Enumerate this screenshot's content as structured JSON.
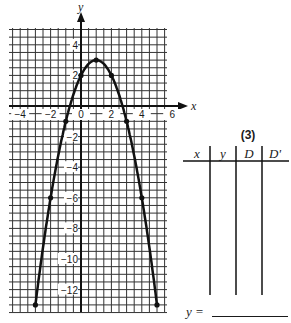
{
  "chart_data": {
    "type": "line",
    "title": "",
    "xlabel": "x",
    "ylabel": "y",
    "xlim": [
      -4.5,
      6
    ],
    "ylim": [
      -13.5,
      5
    ],
    "grid": true,
    "grid_step": 0.5,
    "x_ticks": [
      -4,
      -2,
      0,
      2,
      4,
      6
    ],
    "y_ticks": [
      4,
      2,
      -2,
      -4,
      -6,
      -8,
      -10,
      -12
    ],
    "series": [
      {
        "name": "parabola",
        "equation": "y = -x^2 + 2x + 2",
        "points": [
          [
            -3,
            -13
          ],
          [
            -2,
            -6
          ],
          [
            -1,
            -1
          ],
          [
            0,
            2
          ],
          [
            1,
            3
          ],
          [
            2,
            2
          ],
          [
            3,
            -1
          ],
          [
            4,
            -6
          ],
          [
            5,
            -13
          ]
        ]
      }
    ]
  },
  "table": {
    "label": "(3)",
    "headers": [
      "x",
      "y",
      "D",
      "D'"
    ],
    "rows": []
  },
  "answer": {
    "prefix": "y =",
    "value": ""
  },
  "axes": {
    "x_label": "x",
    "y_label": "y",
    "x_tick_labels": [
      "-4",
      "-2",
      "0",
      "2",
      "4",
      "6"
    ],
    "y_tick_labels": [
      "4",
      "2",
      "-2",
      "-4",
      "-6",
      "-8",
      "-10",
      "-12"
    ]
  }
}
